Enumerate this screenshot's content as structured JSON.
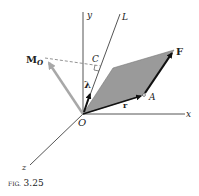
{
  "figure": {
    "caption_prefix": "FIG.",
    "caption_number": "3.25",
    "labels": {
      "y_axis": "y",
      "x_axis": "x",
      "z_axis": "z",
      "line_L": "L",
      "origin": "O",
      "point_C": "C",
      "point_A": "A",
      "force": "F",
      "position_vector": "r",
      "unit_vector": "λ",
      "moment": "M",
      "moment_subscript": "O"
    },
    "colors": {
      "axes": "#555555",
      "parallelogram_fill": "#9a9a9a",
      "moment_arrow": "#a8a8a8",
      "vectors": "#111111"
    }
  }
}
